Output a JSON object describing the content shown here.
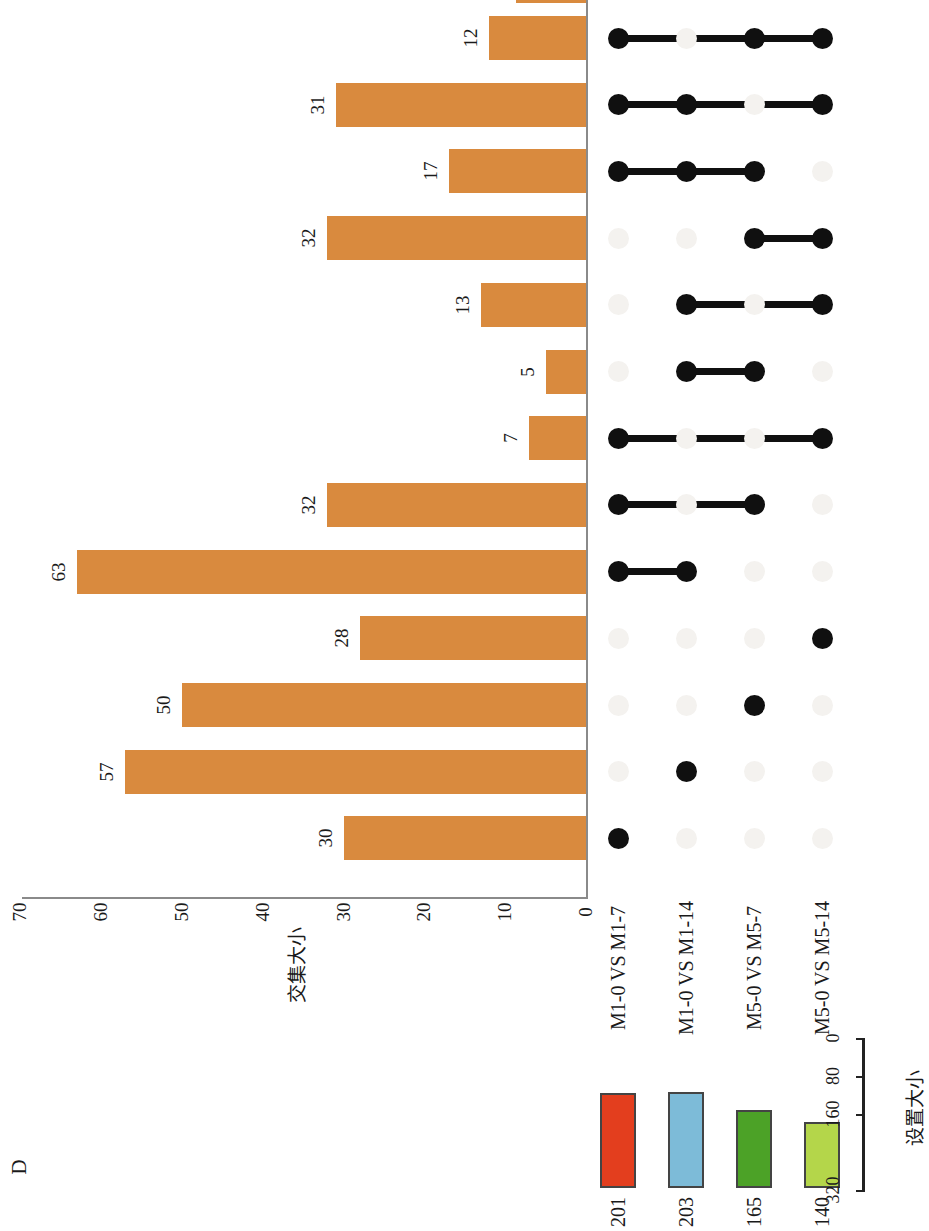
{
  "panel": {
    "letter": "D"
  },
  "chart_data": {
    "type": "bar",
    "title": "",
    "plot_kind": "upset",
    "ylabel": "交集大小",
    "xlabel": "",
    "ylim": [
      0,
      70
    ],
    "yticks": [
      70,
      60,
      50,
      40,
      30,
      20,
      10,
      0
    ],
    "grid": false,
    "orientation": "rotated-90",
    "sets": [
      {
        "name": "M1-0 VS M1-7",
        "size": 201,
        "color": "#e33e1e"
      },
      {
        "name": "M1-0 VS M1-14",
        "size": 203,
        "color": "#7dbbd8"
      },
      {
        "name": "M5-0 VS M5-7",
        "size": 165,
        "color": "#4ca227"
      },
      {
        "name": "M5-0 VS M5-14",
        "size": 140,
        "color": "#b4d64a"
      }
    ],
    "set_size_axis": {
      "label": "设置大小",
      "ticks": [
        0,
        80,
        160,
        320
      ],
      "range": [
        320,
        0
      ]
    },
    "bar_color": "#d98a3e",
    "categories": [
      "M1-0 VS M1-7 + M5-0 VS M5-7 + M5-0 VS M5-14",
      "M1-0 VS M1-7 + M1-0 VS M1-14 + M5-0 VS M5-14",
      "M1-0 VS M1-7 + M1-0 VS M1-14 + M5-0 VS M5-7",
      "M5-0 VS M5-7 + M5-0 VS M5-14",
      "M1-0 VS M1-14 + M5-0 VS M5-14",
      "M1-0 VS M1-14 + M5-0 VS M5-7",
      "M1-0 VS M1-7 + M5-0 VS M5-14",
      "M1-0 VS M1-7 + M5-0 VS M5-7",
      "M1-0 VS M1-7 + M1-0 VS M1-14",
      "M5-0 VS M5-14",
      "M5-0 VS M5-7",
      "M1-0 VS M1-14",
      "M1-0 VS M1-7"
    ],
    "values": [
      12,
      31,
      17,
      32,
      13,
      5,
      7,
      32,
      63,
      28,
      50,
      57,
      30
    ],
    "intersections": [
      {
        "label": "12",
        "value": 12,
        "members": [
          1,
          0,
          1,
          1
        ]
      },
      {
        "label": "31",
        "value": 31,
        "members": [
          1,
          1,
          0,
          1
        ]
      },
      {
        "label": "17",
        "value": 17,
        "members": [
          1,
          1,
          1,
          0
        ]
      },
      {
        "label": "32",
        "value": 32,
        "members": [
          0,
          0,
          1,
          1
        ]
      },
      {
        "label": "13",
        "value": 13,
        "members": [
          0,
          1,
          0,
          1
        ]
      },
      {
        "label": "5",
        "value": 5,
        "members": [
          0,
          1,
          1,
          0
        ]
      },
      {
        "label": "7",
        "value": 7,
        "members": [
          1,
          0,
          0,
          1
        ]
      },
      {
        "label": "32",
        "value": 32,
        "members": [
          1,
          0,
          1,
          0
        ]
      },
      {
        "label": "63",
        "value": 63,
        "members": [
          1,
          1,
          0,
          0
        ]
      },
      {
        "label": "28",
        "value": 28,
        "members": [
          0,
          0,
          0,
          1
        ]
      },
      {
        "label": "50",
        "value": 50,
        "members": [
          0,
          0,
          1,
          0
        ]
      },
      {
        "label": "57",
        "value": 57,
        "members": [
          0,
          1,
          0,
          0
        ]
      },
      {
        "label": "30",
        "value": 30,
        "members": [
          1,
          0,
          0,
          0
        ]
      }
    ]
  }
}
